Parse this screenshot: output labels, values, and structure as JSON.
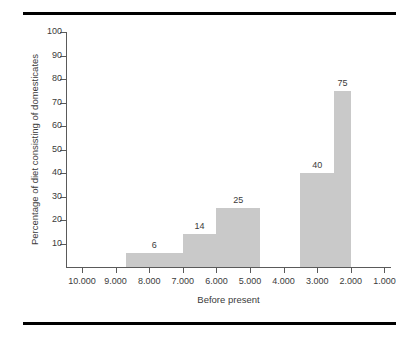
{
  "chart_data": {
    "type": "bar",
    "title": "",
    "xlabel": "Before present",
    "ylabel": "Percentage of diet consisting of domesticates",
    "categories": [
      "9.000-8.000",
      "7.000-6.000",
      "6.000-5.000",
      "5.000-4.000",
      "3.000-2.000",
      "2.500-2.000"
    ],
    "x_tick_labels": [
      "10.000",
      "9.000",
      "8.000",
      "7.000",
      "6.000",
      "5.000",
      "4.000",
      "3.000",
      "2.000",
      "1.000"
    ],
    "y_tick_labels": [
      "10",
      "20",
      "30",
      "40",
      "50",
      "60",
      "70",
      "80",
      "90",
      "100"
    ],
    "ylim": [
      0,
      100
    ],
    "grid": false,
    "legend": null,
    "bar_color": "#c9c9c9",
    "axis_color": "#5a5a5a",
    "text_color": "#3b3b3b",
    "rule_color": "#000000",
    "bars": [
      {
        "label": "6",
        "value": 6,
        "x_start": "8.700",
        "x_end": "7.000"
      },
      {
        "label": "14",
        "value": 14,
        "x_start": "7.000",
        "x_end": "6.000"
      },
      {
        "label": "25",
        "value": 25,
        "x_start": "6.000",
        "x_end": "4.700"
      },
      {
        "label": "40",
        "value": 40,
        "x_start": "3.500",
        "x_end": "2.500"
      },
      {
        "label": "75",
        "value": 75,
        "x_start": "2.500",
        "x_end": "2.000"
      }
    ]
  }
}
